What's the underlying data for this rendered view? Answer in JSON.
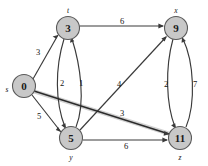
{
  "figure": {
    "kind": "directed-weighted-graph",
    "background_color": "#ffffff",
    "node_fill_color": "#c8c8c8",
    "node_stroke_color": "#5a5a5a",
    "edge_color": "#3a3a3a",
    "highlight_color": "#c9c9c9"
  },
  "nodes": [
    {
      "id": "s",
      "value": "0",
      "name": "s",
      "cx": 24,
      "cy": 86,
      "r": 11.5,
      "name_x": 7,
      "name_y": 89
    },
    {
      "id": "t",
      "value": "3",
      "name": "t",
      "cx": 68,
      "cy": 28,
      "r": 11.5,
      "name_x": 68,
      "name_y": 10
    },
    {
      "id": "x",
      "value": "9",
      "name": "x",
      "cx": 176,
      "cy": 28,
      "r": 11.5,
      "name_x": 176,
      "name_y": 10
    },
    {
      "id": "y",
      "value": "5",
      "name": "y",
      "cx": 71,
      "cy": 138,
      "r": 11.5,
      "name_x": 71,
      "name_y": 157
    },
    {
      "id": "z",
      "value": "11",
      "name": "z",
      "cx": 180,
      "cy": 138,
      "r": 11.5,
      "name_x": 180,
      "name_y": 157
    }
  ],
  "edges": [
    {
      "from": "s",
      "to": "t",
      "weight": "3",
      "label_x": 38,
      "label_y": 52,
      "highlight": false
    },
    {
      "from": "s",
      "to": "y",
      "weight": "5",
      "label_x": 39,
      "label_y": 116,
      "highlight": false
    },
    {
      "from": "t",
      "to": "x",
      "weight": "6",
      "label_x": 122,
      "label_y": 21,
      "highlight": false
    },
    {
      "from": "t",
      "to": "y",
      "weight": "2",
      "label_x": 62,
      "label_y": 83,
      "highlight": false
    },
    {
      "from": "y",
      "to": "t",
      "weight": "1",
      "label_x": 81,
      "label_y": 83,
      "highlight": false
    },
    {
      "from": "y",
      "to": "x",
      "weight": "4",
      "label_x": 119,
      "label_y": 84,
      "highlight": false
    },
    {
      "from": "s",
      "to": "z",
      "weight": "3",
      "label_x": 122,
      "label_y": 113,
      "highlight": true
    },
    {
      "from": "y",
      "to": "z",
      "weight": "6",
      "label_x": 126,
      "label_y": 146,
      "highlight": false
    },
    {
      "from": "x",
      "to": "z",
      "weight": "2",
      "label_x": 166,
      "label_y": 84,
      "highlight": false
    },
    {
      "from": "z",
      "to": "x",
      "weight": "7",
      "label_x": 195,
      "label_y": 84,
      "highlight": false
    }
  ]
}
